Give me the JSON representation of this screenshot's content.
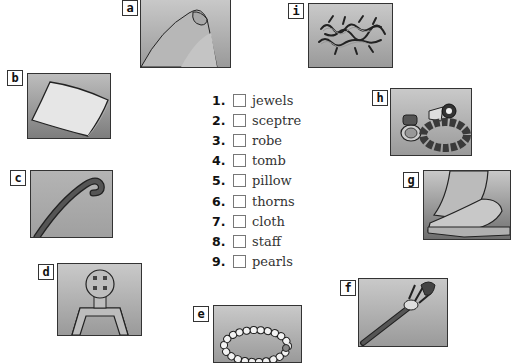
{
  "exercise": {
    "items": [
      {
        "number": "1.",
        "word": "jewels"
      },
      {
        "number": "2.",
        "word": "sceptre"
      },
      {
        "number": "3.",
        "word": "robe"
      },
      {
        "number": "4.",
        "word": "tomb"
      },
      {
        "number": "5.",
        "word": "pillow"
      },
      {
        "number": "6.",
        "word": "thorns"
      },
      {
        "number": "7.",
        "word": "cloth"
      },
      {
        "number": "8.",
        "word": "staff"
      },
      {
        "number": "9.",
        "word": "pearls"
      }
    ]
  },
  "pictures": {
    "a": {
      "label": "a",
      "depicts": "robe"
    },
    "b": {
      "label": "b",
      "depicts": "pillow"
    },
    "c": {
      "label": "c",
      "depicts": "staff"
    },
    "d": {
      "label": "d",
      "depicts": "tomb"
    },
    "e": {
      "label": "e",
      "depicts": "pearls"
    },
    "f": {
      "label": "f",
      "depicts": "sceptre"
    },
    "g": {
      "label": "g",
      "depicts": "cloth"
    },
    "h": {
      "label": "h",
      "depicts": "jewels"
    },
    "i": {
      "label": "i",
      "depicts": "thorns"
    }
  }
}
